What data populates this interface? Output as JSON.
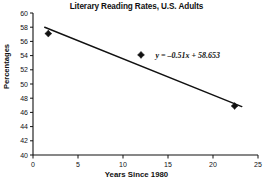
{
  "chart_data": {
    "type": "scatter",
    "title": "Literary Reading Rates, U.S. Adults",
    "xlabel": "Years Since 1980",
    "ylabel": "Percentages",
    "xlim": [
      0,
      25
    ],
    "ylim": [
      40,
      60
    ],
    "xticks": [
      0,
      5,
      10,
      15,
      20,
      25
    ],
    "yticks": [
      40,
      42,
      44,
      46,
      48,
      50,
      52,
      54,
      56,
      58,
      60
    ],
    "xtick_labels": [
      "0",
      "5",
      "10",
      "15",
      "20",
      "25"
    ],
    "ytick_labels": [
      "40",
      "42",
      "44",
      "46",
      "48",
      "50",
      "52",
      "54",
      "56",
      "58",
      "60"
    ],
    "grid": false,
    "legend": "none",
    "points": [
      {
        "x": 1.7,
        "y": 57.1
      },
      {
        "x": 12.0,
        "y": 54.1
      },
      {
        "x": 22.4,
        "y": 46.9
      }
    ],
    "trendline": {
      "slope": -0.51,
      "intercept": 58.653,
      "x_start": 1.3,
      "x_end": 23.2,
      "label": "y = –0.51x + 58.653"
    },
    "annotations": [
      {
        "text": "y = –0.51x + 58.653",
        "x": 17.2,
        "y": 54.1
      }
    ]
  }
}
